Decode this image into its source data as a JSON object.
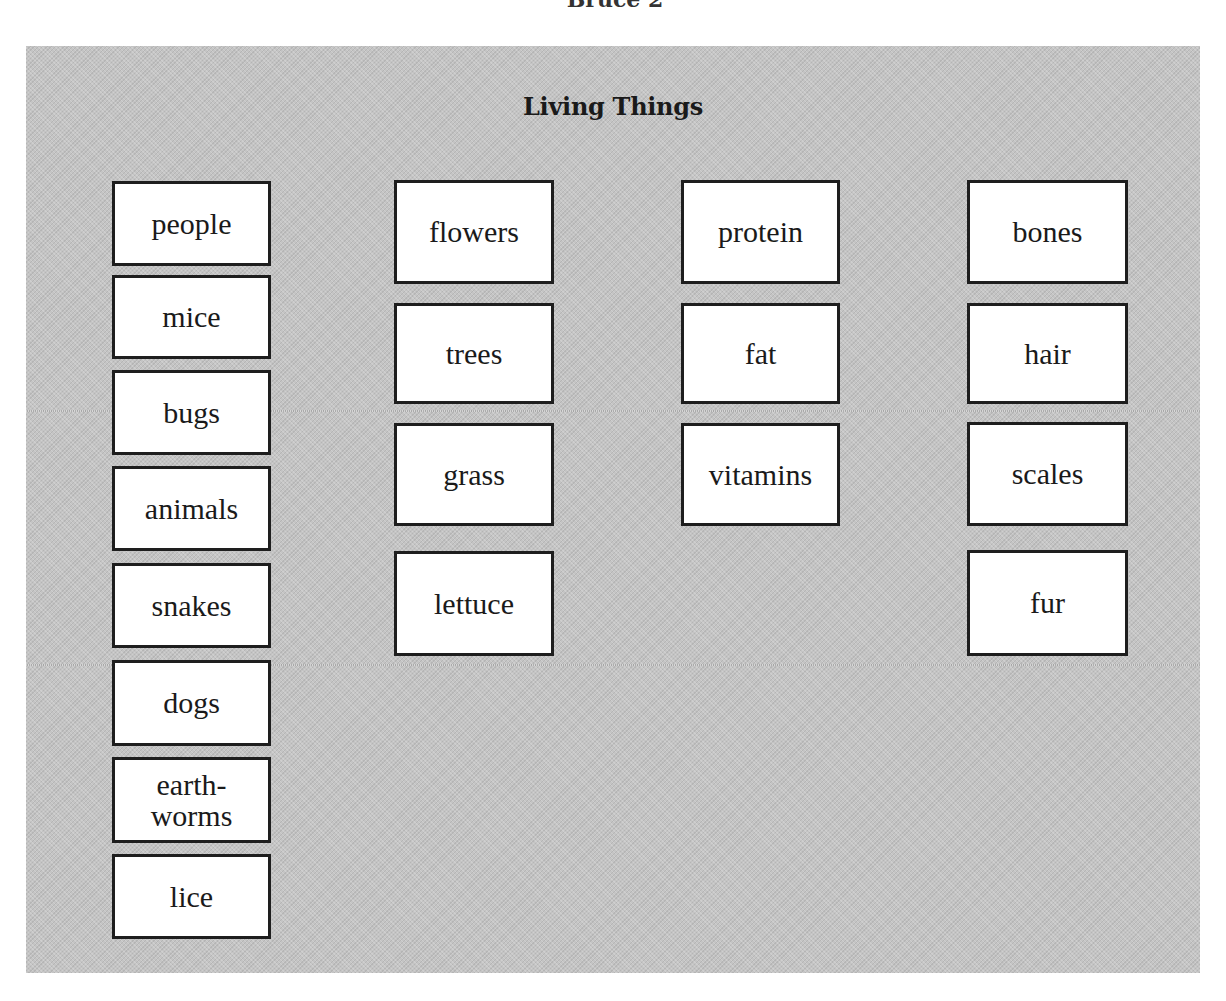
{
  "header": {
    "cut_off_text": "Bruce 2"
  },
  "panel": {
    "title": "Living Things",
    "colors": {
      "background": "#c4c4c4",
      "card": "#ffffff",
      "border": "#1e1e1e"
    }
  },
  "columns": [
    {
      "cards": [
        {
          "label": "people"
        },
        {
          "label": "mice"
        },
        {
          "label": "bugs"
        },
        {
          "label": "animals"
        },
        {
          "label": "snakes"
        },
        {
          "label": "dogs"
        },
        {
          "label": "earth-\nworms"
        },
        {
          "label": "lice"
        }
      ]
    },
    {
      "cards": [
        {
          "label": "flowers"
        },
        {
          "label": "trees"
        },
        {
          "label": "grass"
        },
        {
          "label": "lettuce"
        }
      ]
    },
    {
      "cards": [
        {
          "label": "protein"
        },
        {
          "label": "fat"
        },
        {
          "label": "vitamins"
        }
      ]
    },
    {
      "cards": [
        {
          "label": "bones"
        },
        {
          "label": "hair"
        },
        {
          "label": "scales"
        },
        {
          "label": "fur"
        }
      ]
    }
  ]
}
